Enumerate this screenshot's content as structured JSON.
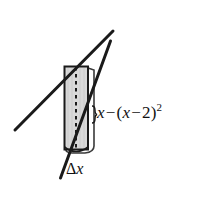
{
  "figure": {
    "name": "cylindrical-shell-diagram",
    "background_color": "#ffffff",
    "width": 208,
    "height": 206,
    "labels": {
      "function_expression": {
        "full_text": "x − (x − 2)²",
        "var1": "x",
        "operator": "−",
        "open_paren": "(",
        "var2": "x",
        "inner_operator": "−",
        "constant": "2",
        "close_paren": ")",
        "exponent": "2"
      },
      "thickness": {
        "full_text": "Δx",
        "delta": "Δ",
        "variable": "x"
      }
    },
    "shapes": {
      "shell": {
        "name": "cylindrical-shell",
        "fill_color": "#d9d9d9",
        "stroke_color": "#1a1a1a",
        "left": 64,
        "right": 88,
        "top": 66,
        "bottom": 150
      },
      "back_outline": {
        "name": "shell-back-edge",
        "stroke_color": "#2b2b2b"
      },
      "center_axis": {
        "name": "dashed-center-axis",
        "stroke_color": "#1a1a1a",
        "style": "dashed"
      },
      "secant_line": {
        "name": "secant-line-shallow",
        "stroke_color": "#1a1a1a",
        "x1": 15,
        "y1": 130,
        "x2": 113,
        "y2": 31
      },
      "tangent_line": {
        "name": "tangent-line-steep",
        "stroke_color": "#1a1a1a",
        "x1": 61,
        "y1": 178,
        "x2": 111,
        "y2": 41
      },
      "brace_marker": {
        "name": "height-brace-marker",
        "stroke_color": "#1a1a1a"
      }
    }
  }
}
